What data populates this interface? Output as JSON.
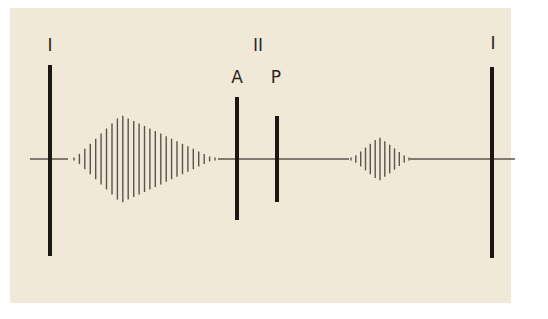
{
  "diagram": {
    "title": "",
    "background_color": "#f1e9d8",
    "ink_color": "#1a1714",
    "trace_color": "#5a544c",
    "baseline_y": 159,
    "labels": [
      {
        "id": "label-I-left",
        "text": "I",
        "x": 50,
        "y": 51
      },
      {
        "id": "label-II",
        "text": "II",
        "x": 258,
        "y": 51
      },
      {
        "id": "label-A",
        "text": "A",
        "x": 237,
        "y": 83
      },
      {
        "id": "label-P",
        "text": "P",
        "x": 276,
        "y": 83
      },
      {
        "id": "label-I-right",
        "text": "I",
        "x": 493,
        "y": 49
      }
    ],
    "bars": [
      {
        "id": "bar-I-left",
        "x": 50,
        "y1": 65,
        "y2": 256,
        "width": 4
      },
      {
        "id": "bar-A",
        "x": 237,
        "y1": 97,
        "y2": 220,
        "width": 4
      },
      {
        "id": "bar-P",
        "x": 277,
        "y1": 116,
        "y2": 202,
        "width": 4
      },
      {
        "id": "bar-I-right",
        "x": 492,
        "y1": 67,
        "y2": 258,
        "width": 4
      }
    ],
    "baseline_segments": [
      {
        "x1": 30,
        "x2": 68
      },
      {
        "x1": 218,
        "x2": 349
      },
      {
        "x1": 410,
        "x2": 515
      }
    ],
    "bursts": [
      {
        "id": "burst-1",
        "x_start": 74,
        "x_end": 215,
        "peak_x": 121,
        "peak_half_height": 44,
        "line_count": 27
      },
      {
        "id": "burst-2",
        "x_start": 351,
        "x_end": 409,
        "peak_x": 379,
        "peak_half_height": 22,
        "line_count": 13
      }
    ]
  }
}
